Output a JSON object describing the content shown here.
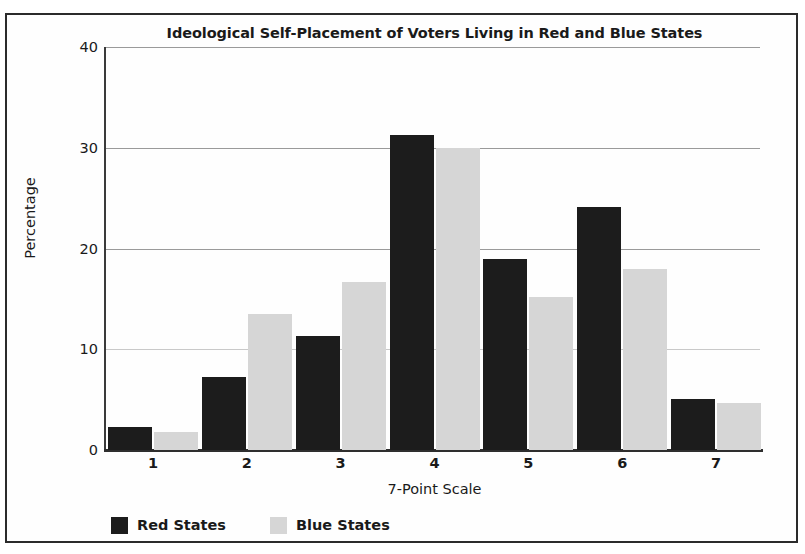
{
  "chart_data": {
    "type": "bar",
    "title": "Ideological Self-Placement of Voters Living in Red and Blue States",
    "xlabel": "7-Point Scale",
    "ylabel": "Percentage",
    "categories": [
      "1",
      "2",
      "3",
      "4",
      "5",
      "6",
      "7"
    ],
    "series": [
      {
        "name": "Red States",
        "color": "#1c1c1c",
        "values": [
          2.3,
          7.2,
          11.3,
          31.3,
          19.0,
          24.1,
          5.1
        ]
      },
      {
        "name": "Blue States",
        "color": "#d6d6d6",
        "values": [
          1.8,
          13.5,
          16.7,
          30.0,
          15.2,
          18.0,
          4.7
        ]
      }
    ],
    "ylim": [
      0,
      40
    ],
    "yticks": [
      "0",
      "10",
      "20",
      "30",
      "40"
    ],
    "ytick_values": [
      0,
      10,
      20,
      30,
      40
    ],
    "grid": "horizontal",
    "legend_position": "bottom-left"
  },
  "legend": {
    "items": [
      {
        "label": "Red States",
        "swatch": "red"
      },
      {
        "label": "Blue States",
        "swatch": "blue"
      }
    ]
  },
  "colors": {
    "red_states": "#1c1c1c",
    "blue_states": "#d6d6d6",
    "frame": "#2b2b2b",
    "gridline": "#9a9a9a",
    "text": "#1a1a1a"
  }
}
